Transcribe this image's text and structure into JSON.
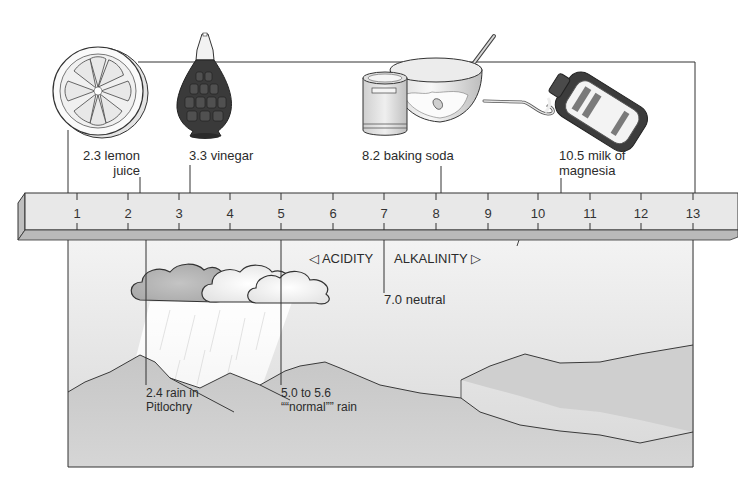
{
  "diagram": {
    "scale": {
      "min": 1,
      "max": 13,
      "ticks": [
        "1",
        "2",
        "3",
        "4",
        "5",
        "6",
        "7",
        "8",
        "9",
        "10",
        "11",
        "12",
        "13"
      ],
      "tick_x": [
        77,
        128,
        179,
        230,
        281,
        333,
        384,
        436,
        488,
        538,
        590,
        641,
        693
      ],
      "bar_color": "#e6e6e6",
      "bar_shadow_color": "#b8b8b8"
    },
    "direction_labels": {
      "acidity": "◁ ACIDITY",
      "alkalinity": "ALKALINITY ▷"
    },
    "household_items": [
      {
        "id": "lemon",
        "value": "2.3",
        "line1": "2.3 lemon",
        "line2": "juice",
        "icon": "lemon-half-icon"
      },
      {
        "id": "vinegar",
        "value": "3.3",
        "line1": "3.3 vinegar",
        "icon": "vinegar-bottle-icon"
      },
      {
        "id": "baking-soda",
        "value": "8.2",
        "line1": "8.2 baking soda",
        "icon": "baking-soda-bowl-icon"
      },
      {
        "id": "milk-of-magnesia",
        "value": "10.5",
        "line1": "10.5 milk of",
        "line2": "magnesia",
        "icon": "medicine-bottle-spoon-icon"
      }
    ],
    "environment_items": [
      {
        "id": "neutral",
        "value": "7.0",
        "line1": "7.0 neutral"
      },
      {
        "id": "pitlochry-rain",
        "value": "2.4",
        "line1": "2.4 rain in",
        "line2": "Pitlochry"
      },
      {
        "id": "normal-rain",
        "value": "5.0 to 5.6",
        "line1": "5.0 to 5.6",
        "line2": "““normal”” rain"
      }
    ],
    "colors": {
      "line": "#333333",
      "sky_top": "#f4f4f4",
      "sky_bottom": "#dcdcdc",
      "hills": "#c9c9c9",
      "hills_far": "#d2d2d2",
      "cloud_dark": "#bdbdbd",
      "cloud_light": "#f7f7f7",
      "bottle_dark": "#3a3a3a"
    }
  }
}
